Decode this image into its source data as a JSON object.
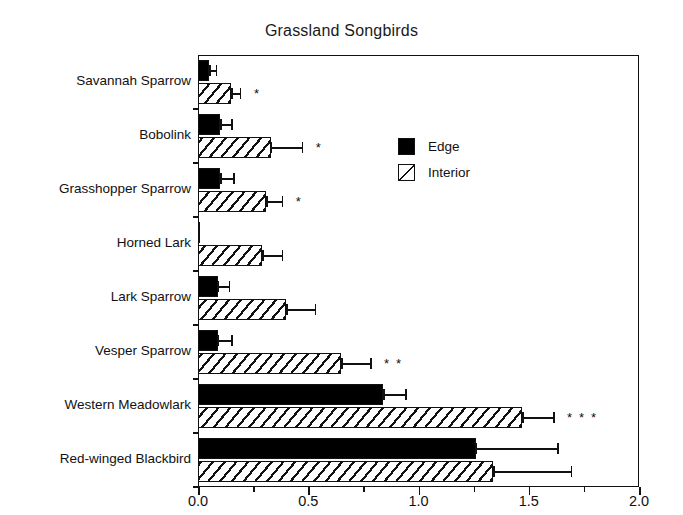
{
  "chart_data": {
    "type": "bar",
    "orientation": "horizontal",
    "title": "Grassland  Songbirds",
    "xlabel": "",
    "ylabel": "",
    "xlim": [
      0.0,
      2.0
    ],
    "xticks": [
      0.0,
      0.5,
      1.0,
      1.5,
      2.0
    ],
    "xtick_labels": [
      "0.0",
      "0.5",
      "1.0",
      "1.5",
      "2.0"
    ],
    "grid": false,
    "legend_position": "upper right inside",
    "legend": [
      "Edge",
      "Interior"
    ],
    "categories": [
      "Savannah Sparrow",
      "Bobolink",
      "Grasshopper Sparrow",
      "Horned Lark",
      "Lark Sparrow",
      "Vesper Sparrow",
      "Western Meadowlark",
      "Red-winged Blackbird"
    ],
    "series": [
      {
        "name": "Edge",
        "fill": "solid-black",
        "values": [
          0.05,
          0.1,
          0.1,
          0.01,
          0.09,
          0.09,
          0.84,
          1.26
        ],
        "errors": [
          0.03,
          0.05,
          0.06,
          0.0,
          0.05,
          0.06,
          0.1,
          0.37
        ]
      },
      {
        "name": "Interior",
        "fill": "hatched",
        "values": [
          0.15,
          0.33,
          0.31,
          0.29,
          0.4,
          0.65,
          1.47,
          1.34
        ],
        "errors": [
          0.04,
          0.14,
          0.07,
          0.09,
          0.13,
          0.13,
          0.14,
          0.35
        ]
      }
    ],
    "significance": [
      "*",
      "*",
      "*",
      "",
      "",
      "* *",
      "* * *",
      ""
    ],
    "significance_note": "asterisks denote significant edge-interior differences"
  },
  "legend": {
    "items": [
      {
        "label": "Edge",
        "swatch": "solid-black"
      },
      {
        "label": "Interior",
        "swatch": "hatched"
      }
    ]
  }
}
